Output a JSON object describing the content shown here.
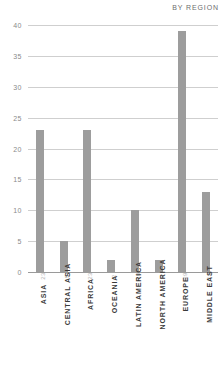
{
  "chart_data": {
    "type": "bar",
    "title": "BY REGION",
    "xlabel": "",
    "ylabel": "",
    "categories": [
      "ASIA",
      "CENTRAL ASIA",
      "AFRICA",
      "OCEANIA",
      "LATIN AMERICA",
      "NORTH AMERICA",
      "EUROPE",
      "MIDDLE EAST"
    ],
    "values": [
      23,
      5,
      23,
      2,
      10,
      2,
      39,
      13
    ],
    "value_labels": [
      "23",
      "5",
      "23",
      "2",
      "10",
      "2",
      "39",
      "13"
    ],
    "ylim": [
      0,
      40
    ],
    "yticks": [
      0,
      5,
      10,
      15,
      20,
      25,
      30,
      35,
      40
    ],
    "ytick_labels": [
      "0",
      "5",
      "10",
      "15",
      "20",
      "25",
      "30",
      "35",
      "40"
    ],
    "grid": true,
    "legend": false,
    "bar_color": "#9d9d9d",
    "gridline_color": "#cfcfcf",
    "axis_color": "#9a9a9a",
    "tick_text_color": "#8a8a8a",
    "label_text_color": "#3a3a3a",
    "title_color": "#6e6e6e"
  }
}
